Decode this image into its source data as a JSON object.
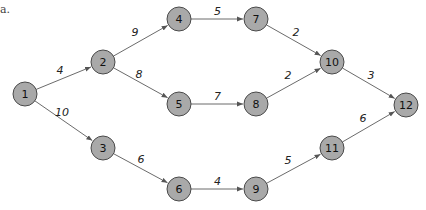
{
  "caption_fragment": "a.",
  "diagram": {
    "type": "directed-network",
    "nodes": [
      {
        "id": "1",
        "label": "1"
      },
      {
        "id": "2",
        "label": "2"
      },
      {
        "id": "3",
        "label": "3"
      },
      {
        "id": "4",
        "label": "4"
      },
      {
        "id": "5",
        "label": "5"
      },
      {
        "id": "6",
        "label": "6"
      },
      {
        "id": "7",
        "label": "7"
      },
      {
        "id": "8",
        "label": "8"
      },
      {
        "id": "9",
        "label": "9"
      },
      {
        "id": "10",
        "label": "10"
      },
      {
        "id": "11",
        "label": "11"
      },
      {
        "id": "12",
        "label": "12"
      }
    ],
    "edges": [
      {
        "from": "1",
        "to": "2",
        "weight": "4"
      },
      {
        "from": "1",
        "to": "3",
        "weight": "10"
      },
      {
        "from": "2",
        "to": "4",
        "weight": "9"
      },
      {
        "from": "2",
        "to": "5",
        "weight": "8"
      },
      {
        "from": "3",
        "to": "6",
        "weight": "6"
      },
      {
        "from": "4",
        "to": "7",
        "weight": "5"
      },
      {
        "from": "5",
        "to": "8",
        "weight": "7"
      },
      {
        "from": "6",
        "to": "9",
        "weight": "4"
      },
      {
        "from": "7",
        "to": "10",
        "weight": "2"
      },
      {
        "from": "8",
        "to": "10",
        "weight": "2"
      },
      {
        "from": "9",
        "to": "11",
        "weight": "5"
      },
      {
        "from": "10",
        "to": "12",
        "weight": "3"
      },
      {
        "from": "11",
        "to": "12",
        "weight": "6"
      }
    ],
    "colors": {
      "node_fill": "#a9a9a9",
      "node_stroke": "#4a4a4a",
      "edge": "#6b6b6b"
    }
  }
}
